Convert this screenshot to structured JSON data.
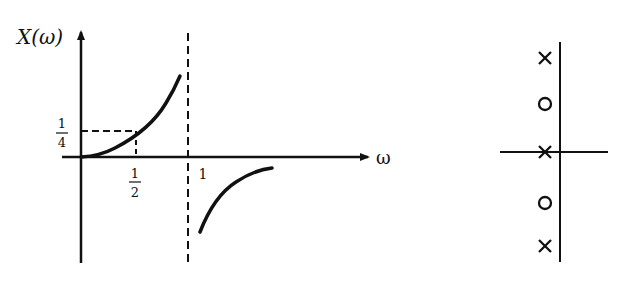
{
  "left_plot": {
    "y_axis_label": "X(ω)",
    "x_axis_label": "ω",
    "x_tick_half": {
      "num": "1",
      "den": "2"
    },
    "x_tick_one": "1",
    "y_tick_quarter": {
      "num": "1",
      "den": "4"
    },
    "asymptote": "ω = 1 (dashed vertical)"
  },
  "right_plot": {
    "description": "pole-zero plot",
    "markers": [
      {
        "type": "pole",
        "symbol": "×"
      },
      {
        "type": "zero",
        "symbol": "o"
      },
      {
        "type": "pole",
        "symbol": "×"
      },
      {
        "type": "zero",
        "symbol": "o"
      },
      {
        "type": "pole",
        "symbol": "×"
      }
    ]
  }
}
